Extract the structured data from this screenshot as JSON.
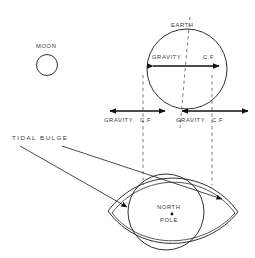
{
  "diagram": {
    "background_color": "#ffffff",
    "line_color": "#1a1a1a",
    "dash_color": "#555555",
    "text_color": "#3a3a3a"
  },
  "labels": {
    "moon": "MOON",
    "earth": "EARTH",
    "tidal_bulge": "TIDAL BULGE",
    "north_pole_line1": "NORTH",
    "north_pole_line2": "POLE",
    "gravity_center": "GRAVITY",
    "cf_center": "C.F",
    "gravity_left": "GRAVITY",
    "cf_left": "C.F",
    "gravity_right": "GRAVITY",
    "cf_right": "C.F"
  },
  "shapes": {
    "moon_circle": {
      "cx": 47,
      "cy": 65,
      "r": 10.5
    },
    "earth_circle": {
      "cx": 187,
      "cy": 69,
      "r": 40
    },
    "north_pole_circle": {
      "cx": 166,
      "cy": 212,
      "r": 38
    },
    "north_pole_dot": {
      "cx": 172,
      "cy": 214,
      "r": 1.4
    },
    "bulge_left_tip": {
      "x": 108,
      "y": 211
    },
    "bulge_right_tip": {
      "x": 238,
      "y": 212
    }
  },
  "arrows": {
    "center_pair": {
      "y": 66,
      "left_x": 152,
      "right_x": 220,
      "description": "double-headed arrow inside earth"
    },
    "left_pair": {
      "y": 111,
      "gravity_tail_x": 143,
      "gravity_head_x": 108,
      "cf_tail_x": 143,
      "cf_head_x": 167
    },
    "right_pair": {
      "y": 111,
      "gravity_head_x": 180,
      "gravity_tail_x": 212,
      "cf_tail_x": 212,
      "cf_head_x": 250
    }
  }
}
